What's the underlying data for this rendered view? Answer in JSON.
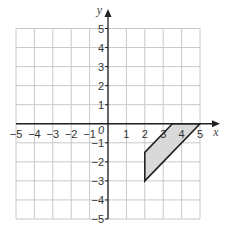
{
  "chart_data": {
    "type": "coordinate-grid",
    "title": "",
    "xlabel": "x",
    "ylabel": "y",
    "origin_label": "0",
    "xlim": [
      -5,
      5
    ],
    "ylim": [
      -5,
      5
    ],
    "grid": true,
    "x_ticks": [
      -5,
      -4,
      -3,
      -2,
      -1,
      1,
      2,
      3,
      4,
      5
    ],
    "y_ticks": [
      -5,
      -4,
      -3,
      -2,
      -1,
      1,
      2,
      3,
      4,
      5
    ],
    "x_tick_labels": [
      "−5",
      "−4",
      "−3",
      "−2",
      "−1",
      "1",
      "2",
      "3",
      "4",
      "5"
    ],
    "y_tick_labels": [
      "−5",
      "−4",
      "−3",
      "−2",
      "−1",
      "1",
      "2",
      "3",
      "4",
      "5"
    ],
    "shapes": [
      {
        "type": "polygon",
        "name": "shaded-parallelogram",
        "vertices": [
          [
            2,
            -3
          ],
          [
            2,
            -1.5
          ],
          [
            3.5,
            0
          ],
          [
            5,
            0
          ]
        ],
        "fill": "#d9d9d9",
        "stroke": "#222222"
      }
    ]
  },
  "colors": {
    "grid": "#c8c8c8",
    "axis": "#222222",
    "shape_fill": "#d9d9d9",
    "shape_stroke": "#222222"
  }
}
